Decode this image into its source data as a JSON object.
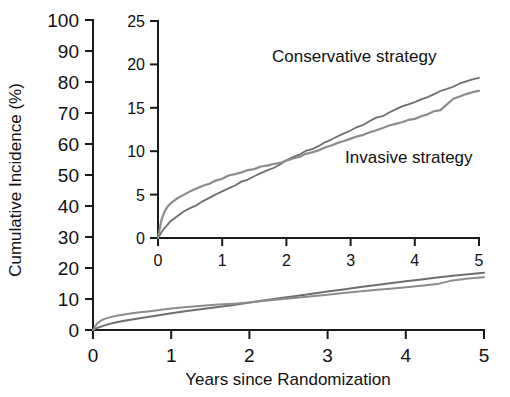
{
  "chart_data": {
    "type": "line",
    "title": "",
    "xlabel": "Years since Randomization",
    "ylabel": "Cumulative Incidence (%)",
    "xlim": [
      0,
      5
    ],
    "ylim": [
      0,
      100
    ],
    "xticks": [
      "0",
      "1",
      "2",
      "3",
      "4",
      "5"
    ],
    "yticks": [
      "0",
      "10",
      "20",
      "30",
      "40",
      "50",
      "60",
      "70",
      "80",
      "90",
      "100"
    ],
    "grid": false,
    "legend_position": "inline-annotations",
    "series": [
      {
        "name": "Conservative strategy",
        "color": "#6e6e6e",
        "x": [
          0,
          0.05,
          0.1,
          0.15,
          0.2,
          0.3,
          0.4,
          0.5,
          0.6,
          0.7,
          0.8,
          0.9,
          1.0,
          1.2,
          1.4,
          1.6,
          1.8,
          2.0,
          2.2,
          2.4,
          2.6,
          2.8,
          3.0,
          3.2,
          3.4,
          3.6,
          3.8,
          4.0,
          4.2,
          4.4,
          4.6,
          4.8,
          5.0
        ],
        "values": [
          0,
          0.6,
          1.1,
          1.5,
          1.9,
          2.5,
          3.0,
          3.4,
          3.8,
          4.2,
          4.6,
          5.0,
          5.4,
          6.1,
          6.8,
          7.4,
          8.1,
          8.9,
          9.6,
          10.3,
          11.0,
          11.7,
          12.4,
          13.1,
          13.8,
          14.4,
          15.1,
          15.7,
          16.3,
          16.9,
          17.5,
          18.0,
          18.5
        ]
      },
      {
        "name": "Invasive strategy",
        "color": "#8c8c8c",
        "x": [
          0,
          0.05,
          0.1,
          0.15,
          0.2,
          0.3,
          0.4,
          0.5,
          0.6,
          0.7,
          0.8,
          0.9,
          1.0,
          1.2,
          1.4,
          1.6,
          1.8,
          2.0,
          2.2,
          2.4,
          2.6,
          2.8,
          3.0,
          3.2,
          3.4,
          3.6,
          3.8,
          4.0,
          4.2,
          4.4,
          4.6,
          4.8,
          5.0
        ],
        "values": [
          0,
          2.0,
          3.0,
          3.6,
          4.0,
          4.6,
          5.0,
          5.4,
          5.7,
          6.0,
          6.3,
          6.6,
          6.9,
          7.4,
          7.8,
          8.2,
          8.5,
          8.9,
          9.4,
          9.9,
          10.4,
          10.9,
          11.4,
          11.9,
          12.4,
          12.9,
          13.3,
          13.8,
          14.3,
          14.8,
          16.0,
          16.6,
          17.0
        ]
      }
    ],
    "inset": {
      "type": "line",
      "xlim": [
        0,
        5
      ],
      "ylim": [
        0,
        25
      ],
      "xticks": [
        "0",
        "1",
        "2",
        "3",
        "4",
        "5"
      ],
      "yticks": [
        "0",
        "5",
        "10",
        "15",
        "20",
        "25"
      ],
      "grid": false,
      "annotations": [
        {
          "text": "Conservative strategy",
          "series": "Conservative strategy"
        },
        {
          "text": "Invasive strategy",
          "series": "Invasive strategy"
        }
      ]
    }
  }
}
